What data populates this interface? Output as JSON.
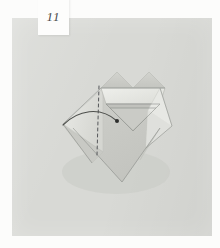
{
  "page": {
    "kind": "origami-instruction-photo",
    "step_label": "11",
    "background_color": "#d8d9d5",
    "board_color": "#d8d9d5",
    "frame_color": "#fcfcfb",
    "paper_color": "#cfd0cb",
    "paper_light_color": "#e6e7e3",
    "paper_mid_color": "#c6c7c2",
    "paper_shadow_color": "#b9bab5",
    "line_color": "#5c5e5a",
    "dashed_line_color": "#55575a",
    "dot_color": "#2e2f2d"
  },
  "step_tab": {
    "number": "11",
    "text_color": "#4a4a4a",
    "background": "#fdfdfc"
  },
  "figure": {
    "annotations": {
      "fold_line_style": "dashed",
      "arrow_style": "curved-arc",
      "arrow_endpoint_marker": "dot"
    },
    "alt": "Origami model viewed from above with a zigzag upper edge, a dashed vertical valley-fold line and a curved arrow ending in a dot."
  }
}
